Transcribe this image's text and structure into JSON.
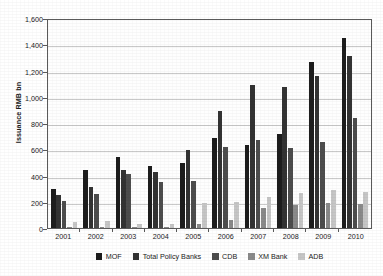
{
  "chart_data": {
    "type": "bar",
    "title": "",
    "xlabel": "",
    "ylabel": "Issuance RMB bn",
    "ylim": [
      0,
      1600
    ],
    "ytick_step": 200,
    "ytick_labels": [
      "1,600",
      "1,400",
      "1,200",
      "1,000",
      "800",
      "600",
      "400",
      "200",
      "0"
    ],
    "ytick_values": [
      1600,
      1400,
      1200,
      1000,
      800,
      600,
      400,
      200,
      0
    ],
    "grid": "horizontal",
    "legend_position": "bottom",
    "categories": [
      "2001",
      "2002",
      "2003",
      "2004",
      "2005",
      "2006",
      "2007",
      "2008",
      "2009",
      "2010"
    ],
    "series": [
      {
        "name": "MOF",
        "color": "#1d1d1d",
        "values": [
          300,
          440,
          540,
          470,
          495,
          685,
          630,
          715,
          1262,
          1447
        ]
      },
      {
        "name": "Total Policy Banks",
        "color": "#333333",
        "values": [
          255,
          313,
          445,
          428,
          597,
          890,
          1088,
          1075,
          1158,
          1310
        ]
      },
      {
        "name": "CDB",
        "color": "#4d4d4d",
        "values": [
          205,
          258,
          415,
          352,
          360,
          620,
          670,
          610,
          658,
          840
        ]
      },
      {
        "name": "XM Bank",
        "color": "#8a8a8a",
        "values": [
          8,
          6,
          5,
          6,
          30,
          62,
          155,
          172,
          188,
          180
        ]
      },
      {
        "name": "ADB",
        "color": "#c6c6c6",
        "values": [
          45,
          53,
          27,
          28,
          193,
          195,
          240,
          270,
          293,
          272
        ]
      }
    ]
  },
  "legend": {
    "items": [
      {
        "label": "MOF"
      },
      {
        "label": "Total Policy Banks"
      },
      {
        "label": "CDB"
      },
      {
        "label": "XM Bank"
      },
      {
        "label": "ADB"
      }
    ]
  }
}
